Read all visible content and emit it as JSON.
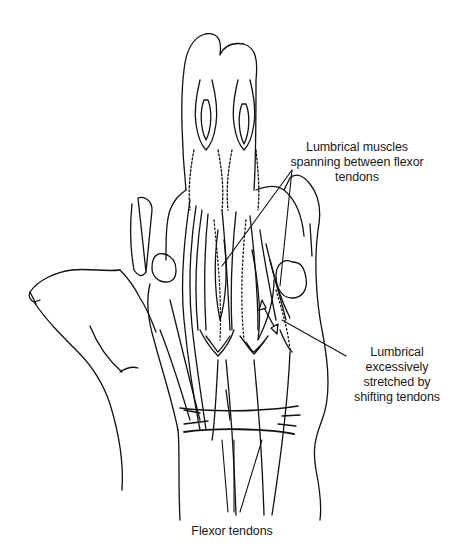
{
  "figure": {
    "colors": {
      "line": "#111111",
      "background": "#ffffff",
      "text": "#1a1a1a"
    }
  },
  "labels": {
    "lumbrical_spanning": {
      "lines": [
        "Lumbrical muscles",
        "spanning between flexor",
        "tendons"
      ]
    },
    "lumbrical_stretched": {
      "lines": [
        "Lumbrical",
        "excessively",
        "stretched by",
        "shifting tendons"
      ]
    },
    "flexor_tendons": {
      "lines": [
        "Flexor tendons"
      ]
    }
  }
}
